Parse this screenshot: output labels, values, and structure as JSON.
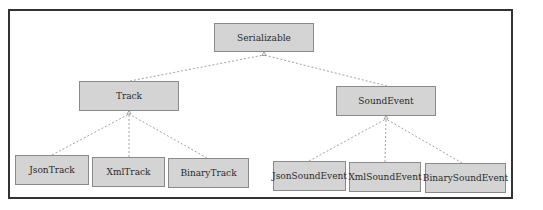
{
  "diagram": {
    "type": "class-hierarchy",
    "colors": {
      "node_fill": "#d4d4d4",
      "node_border": "#8a8a8a",
      "edge": "#8a8a8a",
      "frame": "#333333"
    },
    "nodes": {
      "serializable": "Serializable",
      "track": "Track",
      "sound_event": "SoundEvent",
      "json_track": "JsonTrack",
      "xml_track": "XmlTrack",
      "binary_track": "BinaryTrack",
      "json_sound_event": "JsonSoundEvent",
      "xml_sound_event": "XmlSoundEvent",
      "binary_sound_event": "BinarySoundEvent"
    },
    "edges": [
      {
        "from": "Track",
        "to": "Serializable",
        "style": "dashed",
        "arrow": "hollow-triangle"
      },
      {
        "from": "SoundEvent",
        "to": "Serializable",
        "style": "dashed",
        "arrow": "hollow-triangle"
      },
      {
        "from": "JsonTrack",
        "to": "Track",
        "style": "dashed",
        "arrow": "hollow-triangle"
      },
      {
        "from": "XmlTrack",
        "to": "Track",
        "style": "dashed",
        "arrow": "hollow-triangle"
      },
      {
        "from": "BinaryTrack",
        "to": "Track",
        "style": "dashed",
        "arrow": "hollow-triangle"
      },
      {
        "from": "JsonSoundEvent",
        "to": "SoundEvent",
        "style": "dashed",
        "arrow": "hollow-triangle"
      },
      {
        "from": "XmlSoundEvent",
        "to": "SoundEvent",
        "style": "dashed",
        "arrow": "hollow-triangle"
      },
      {
        "from": "BinarySoundEvent",
        "to": "SoundEvent",
        "style": "dashed",
        "arrow": "hollow-triangle"
      }
    ]
  }
}
